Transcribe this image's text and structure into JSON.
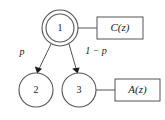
{
  "diagram": {
    "type": "state-transition-graph",
    "background_color": "#ffffff",
    "stroke_color": "#555555",
    "text_color": "#1a1a1a",
    "nodes": [
      {
        "id": "1",
        "label": "1",
        "shape": "double-circle",
        "cx": 60,
        "cy": 28,
        "r_outer": 18,
        "r_inner": 14
      },
      {
        "id": "2",
        "label": "2",
        "shape": "circle",
        "cx": 36,
        "cy": 90,
        "r_outer": 17
      },
      {
        "id": "3",
        "label": "3",
        "shape": "circle",
        "cx": 79,
        "cy": 90,
        "r_outer": 17
      }
    ],
    "boxes": [
      {
        "id": "C",
        "label": "C(z)",
        "x": 97,
        "y": 17,
        "width": 46,
        "height": 22,
        "attached_to": "1"
      },
      {
        "id": "A",
        "label": "A(z)",
        "x": 115,
        "y": 79,
        "width": 45,
        "height": 22,
        "attached_to": "3"
      }
    ],
    "edges": [
      {
        "from": "1",
        "to": "2",
        "label": "p",
        "arrow": true,
        "label_x": 22,
        "label_y": 53
      },
      {
        "from": "1",
        "to": "3",
        "label": "1 − p",
        "arrow": true,
        "label_x": 96,
        "label_y": 52
      },
      {
        "from": "1",
        "to": "C",
        "label": "",
        "arrow": false
      },
      {
        "from": "3",
        "to": "A",
        "label": "",
        "arrow": false
      }
    ]
  }
}
